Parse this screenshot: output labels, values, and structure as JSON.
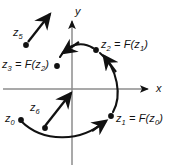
{
  "figure": {
    "background_color": "#ffffff",
    "ink_color": "#111111",
    "axis_color": "#8d8d8d",
    "width": 175,
    "height": 165
  },
  "axes": {
    "x_label": "x",
    "y_label": "y",
    "origin": {
      "x": 72,
      "y": 89
    },
    "x_axis": {
      "start_x": 3,
      "end_x": 152,
      "y": 89
    },
    "y_axis": {
      "x": 72,
      "start_y": 18,
      "end_y": 165
    }
  },
  "orbit": {
    "type": "arc",
    "center": {
      "x": 72,
      "y": 89
    },
    "radius": 44,
    "direction": "counterclockwise"
  },
  "points": [
    {
      "id": "z5",
      "label": "z",
      "sub": "5",
      "suffix": "",
      "x": 26,
      "y": 45,
      "label_x": 14,
      "label_y": 31
    },
    {
      "id": "z3",
      "label": "z",
      "sub": "3",
      "suffix": " = F(z2)",
      "x": 57,
      "y": 66,
      "label_x": 3,
      "label_y": 58
    },
    {
      "id": "z2",
      "label": "z",
      "sub": "2",
      "suffix": " = F(z1)",
      "x": 96,
      "y": 50,
      "label_x": 101,
      "label_y": 42
    },
    {
      "id": "z1",
      "label": "z",
      "sub": "1",
      "suffix": " = F(z0)",
      "x": 111,
      "y": 116,
      "label_x": 116,
      "label_y": 115
    },
    {
      "id": "z0",
      "label": "z",
      "sub": "0",
      "suffix": "",
      "x": 21,
      "y": 120,
      "label_x": 6,
      "label_y": 113
    },
    {
      "id": "z6",
      "label": "z",
      "sub": "6",
      "suffix": "",
      "x": 45,
      "y": 128,
      "label_x": 30,
      "label_y": 104
    }
  ],
  "labels": {
    "z5": {
      "base": "z",
      "sub": "5",
      "rest": ""
    },
    "z3": {
      "base": "z",
      "sub": "3",
      "rest": " = F(",
      "fbase": "z",
      "fsub": "2",
      "close": ")"
    },
    "z2": {
      "base": "z",
      "sub": "2",
      "rest": " = F(",
      "fbase": "z",
      "fsub": "1",
      "close": ")"
    },
    "z1": {
      "base": "z",
      "sub": "1",
      "rest": " = F(",
      "fbase": "z",
      "fsub": "0",
      "close": ")"
    },
    "z0": {
      "base": "z",
      "sub": "0",
      "rest": ""
    },
    "z6": {
      "base": "z",
      "sub": "6",
      "rest": ""
    }
  },
  "vectors": [
    {
      "id": "z5-arrow",
      "from_x": 28,
      "from_y": 42,
      "to_x": 50,
      "to_y": 13
    },
    {
      "id": "z6-arrow",
      "from_x": 44,
      "from_y": 126,
      "to_x": 71,
      "to_y": 92
    }
  ]
}
